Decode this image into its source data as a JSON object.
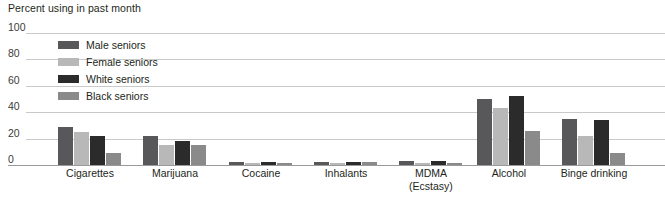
{
  "chart_data": {
    "type": "bar",
    "title": "Percent using in past month",
    "xlabel": "",
    "ylabel": "",
    "ylim": [
      0,
      100
    ],
    "yticks": [
      0,
      20,
      40,
      60,
      80,
      100
    ],
    "grid": true,
    "legend_position": "inside-top-left",
    "categories": [
      "Cigarettes",
      "Marijuana",
      "Cocaine",
      "Inhalants",
      "MDMA (Ecstasy)",
      "Alcohol",
      "Binge drinking"
    ],
    "series": [
      {
        "name": "Male seniors",
        "color": "#58585a",
        "values": [
          29,
          22,
          2,
          2,
          3,
          50,
          35
        ]
      },
      {
        "name": "Female seniors",
        "color": "#b8b8b8",
        "values": [
          25,
          15,
          1,
          1,
          1,
          43,
          22
        ]
      },
      {
        "name": "White seniors",
        "color": "#2b2b2b",
        "values": [
          22,
          18,
          2,
          2,
          3,
          52,
          34
        ]
      },
      {
        "name": "Black seniors",
        "color": "#8a8a8a",
        "values": [
          9,
          15,
          1,
          2,
          1,
          26,
          9
        ]
      }
    ]
  },
  "axis": {
    "tick_labels": [
      "100",
      "80",
      "60",
      "40",
      "20",
      "0"
    ]
  },
  "categories_display": [
    {
      "line1": "Cigarettes",
      "line2": ""
    },
    {
      "line1": "Marijuana",
      "line2": ""
    },
    {
      "line1": "Cocaine",
      "line2": ""
    },
    {
      "line1": "Inhalants",
      "line2": ""
    },
    {
      "line1": "MDMA",
      "line2": "(Ecstasy)"
    },
    {
      "line1": "Alcohol",
      "line2": ""
    },
    {
      "line1": "Binge drinking",
      "line2": ""
    }
  ]
}
